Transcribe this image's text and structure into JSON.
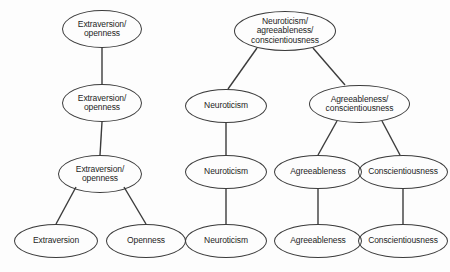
{
  "diagram": {
    "type": "tree-diagram",
    "background_color": "#fdfdfd",
    "node_stroke_color": "#3b3b3b",
    "edge_color": "#3b3b3b",
    "text_color": "#1d1d1d",
    "trees": [
      {
        "name": "extraversion-openness-tree",
        "nodes": [
          {
            "id": "eo-l1",
            "label": "Extraversion/\nopenness",
            "level": 1,
            "x": 62,
            "y": 10,
            "w": 80,
            "h": 38,
            "font_size": 8.5
          },
          {
            "id": "eo-l2",
            "label": "Extraversion/\nopenness",
            "level": 2,
            "x": 62,
            "y": 84,
            "w": 80,
            "h": 38,
            "font_size": 8.5
          },
          {
            "id": "eo-l3",
            "label": "Extraversion/\nopenness",
            "level": 3,
            "x": 58,
            "y": 155,
            "w": 84,
            "h": 38,
            "font_size": 8.5
          },
          {
            "id": "eo-extraversion",
            "label": "Extraversion",
            "level": 4,
            "x": 14,
            "y": 224,
            "w": 84,
            "h": 34,
            "font_size": 8.5
          },
          {
            "id": "eo-openness",
            "label": "Openness",
            "level": 4,
            "x": 106,
            "y": 224,
            "w": 80,
            "h": 34,
            "font_size": 8.5
          }
        ],
        "edges": [
          {
            "from": "eo-l1",
            "to": "eo-l2",
            "x1": 102,
            "y1": 48,
            "x2": 102,
            "y2": 84
          },
          {
            "from": "eo-l2",
            "to": "eo-l3",
            "x1": 102,
            "y1": 122,
            "x2": 100,
            "y2": 155
          },
          {
            "from": "eo-l3",
            "to": "eo-extraversion",
            "x1": 76,
            "y1": 187,
            "x2": 56,
            "y2": 224
          },
          {
            "from": "eo-l3",
            "to": "eo-openness",
            "x1": 124,
            "y1": 187,
            "x2": 146,
            "y2": 224
          }
        ]
      },
      {
        "name": "neuroticism-agreeableness-conscientiousness-tree",
        "nodes": [
          {
            "id": "nac-l1",
            "label": "Neuroticism/\nagreeableness/\nconscientiousness",
            "level": 1,
            "x": 234,
            "y": 11,
            "w": 102,
            "h": 40,
            "font_size": 8.5
          },
          {
            "id": "n-l2",
            "label": "Neuroticism",
            "level": 2,
            "x": 185,
            "y": 89,
            "w": 82,
            "h": 34,
            "font_size": 8.5
          },
          {
            "id": "ac-l2",
            "label": "Agreeableness/\nconscientiousness",
            "level": 2,
            "x": 309,
            "y": 85,
            "w": 101,
            "h": 38,
            "font_size": 8.5
          },
          {
            "id": "n-l3",
            "label": "Neuroticism",
            "level": 3,
            "x": 185,
            "y": 155,
            "w": 82,
            "h": 34,
            "font_size": 8.5
          },
          {
            "id": "a-l3",
            "label": "Agreeableness",
            "level": 3,
            "x": 274,
            "y": 155,
            "w": 88,
            "h": 34,
            "font_size": 8.5
          },
          {
            "id": "c-l3",
            "label": "Conscientiousness",
            "level": 3,
            "x": 358,
            "y": 155,
            "w": 90,
            "h": 34,
            "font_size": 8.5
          },
          {
            "id": "n-l4",
            "label": "Neuroticism",
            "level": 4,
            "x": 185,
            "y": 224,
            "w": 82,
            "h": 34,
            "font_size": 8.5
          },
          {
            "id": "a-l4",
            "label": "Agreeableness",
            "level": 4,
            "x": 274,
            "y": 224,
            "w": 88,
            "h": 34,
            "font_size": 8.5
          },
          {
            "id": "c-l4",
            "label": "Conscientiousness",
            "level": 4,
            "x": 358,
            "y": 224,
            "w": 90,
            "h": 34,
            "font_size": 8.5
          }
        ],
        "edges": [
          {
            "from": "nac-l1",
            "to": "n-l2",
            "x1": 257,
            "y1": 48,
            "x2": 228,
            "y2": 89
          },
          {
            "from": "nac-l1",
            "to": "ac-l2",
            "x1": 313,
            "y1": 48,
            "x2": 345,
            "y2": 85
          },
          {
            "from": "n-l2",
            "to": "n-l3",
            "x1": 226,
            "y1": 123,
            "x2": 226,
            "y2": 155
          },
          {
            "from": "ac-l2",
            "to": "a-l3",
            "x1": 337,
            "y1": 121,
            "x2": 318,
            "y2": 155
          },
          {
            "from": "ac-l2",
            "to": "c-l3",
            "x1": 382,
            "y1": 121,
            "x2": 400,
            "y2": 155
          },
          {
            "from": "n-l3",
            "to": "n-l4",
            "x1": 226,
            "y1": 189,
            "x2": 226,
            "y2": 224
          },
          {
            "from": "a-l3",
            "to": "a-l4",
            "x1": 318,
            "y1": 189,
            "x2": 318,
            "y2": 224
          },
          {
            "from": "c-l3",
            "to": "c-l4",
            "x1": 403,
            "y1": 189,
            "x2": 403,
            "y2": 224
          }
        ]
      }
    ]
  }
}
